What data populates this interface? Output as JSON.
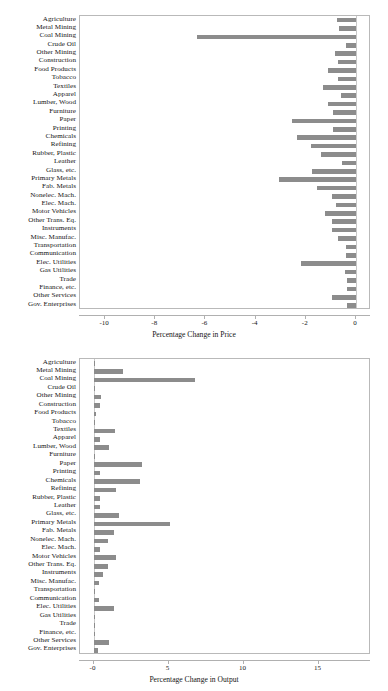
{
  "chart_data": [
    {
      "id": "price",
      "type": "bar",
      "orientation": "horizontal",
      "title": "",
      "xlabel": "Percentage Change in Price",
      "ylabel": "",
      "xlim": [
        -11.0,
        0.6
      ],
      "xticks": [
        -10,
        -8,
        -6,
        -4,
        -2,
        0
      ],
      "xticklabels": [
        "-10",
        "-8",
        "-6",
        "-4",
        "-2",
        "0"
      ],
      "grid": false,
      "legend": false,
      "bar_color": "#8c8c8c",
      "categories": [
        "Agriculture",
        "Metal Mining",
        "Coal Mining",
        "Crude Oil",
        "Other Mining",
        "Construction",
        "Food Products",
        "Tobacco",
        "Textiles",
        "Apparel",
        "Lumber, Wood",
        "Furniture",
        "Paper",
        "Printing",
        "Chemicals",
        "Refining",
        "Rubber, Plastic",
        "Leather",
        "Glass, etc.",
        "Primary Metals",
        "Fab. Metals",
        "Nonelec. Mach.",
        "Elec. Mach.",
        "Motor Vehicles",
        "Other Trans. Eq.",
        "Instruments",
        "Misc. Manufac.",
        "Transportation",
        "Communication",
        "Elec. Utilities",
        "Gas Utilities",
        "Trade",
        "Finance, etc.",
        "Other Services",
        "Gov. Enterprises"
      ],
      "values": [
        -0.75,
        -0.68,
        -6.35,
        -0.38,
        -0.82,
        -0.73,
        -1.12,
        -0.72,
        -1.3,
        -0.6,
        -1.12,
        -0.93,
        -2.55,
        -0.93,
        -2.35,
        -1.8,
        -1.4,
        -0.55,
        -1.75,
        -3.05,
        -1.55,
        -0.95,
        -0.8,
        -1.25,
        -0.95,
        -0.95,
        -0.7,
        -0.4,
        -0.4,
        -2.2,
        -0.45,
        -0.35,
        -0.35,
        -0.95,
        -0.35
      ]
    },
    {
      "id": "output",
      "type": "bar",
      "orientation": "horizontal",
      "title": "",
      "xlabel": "Percentage Change in Output",
      "ylabel": "",
      "xlim": [
        -0.9,
        18.5
      ],
      "xticks": [
        0,
        5,
        10,
        15
      ],
      "xticklabels": [
        "-0",
        "5",
        "10",
        "15"
      ],
      "grid": false,
      "legend": false,
      "bar_color": "#8c8c8c",
      "categories": [
        "Agriculture",
        "Metal Mining",
        "Coal Mining",
        "Crude Oil",
        "Other Mining",
        "Construction",
        "Food Products",
        "Tobacco",
        "Textiles",
        "Apparel",
        "Lumber, Wood",
        "Furniture",
        "Paper",
        "Printing",
        "Chemicals",
        "Refining",
        "Rubber, Plastic",
        "Leather",
        "Glass, etc.",
        "Primary Metals",
        "Fab. Metals",
        "Nonelec. Mach.",
        "Elec. Mach.",
        "Motor Vehicles",
        "Other Trans. Eq.",
        "Instruments",
        "Misc. Manufac.",
        "Transportation",
        "Communication",
        "Elec. Utilities",
        "Gas Utilities",
        "Trade",
        "Finance, etc.",
        "Other Services",
        "Gov. Enterprises"
      ],
      "values": [
        0.05,
        1.95,
        6.75,
        0.05,
        0.5,
        0.42,
        0.15,
        0.1,
        1.4,
        0.45,
        1.0,
        0.1,
        3.2,
        0.45,
        3.1,
        1.5,
        0.45,
        0.42,
        1.7,
        5.1,
        1.35,
        0.95,
        0.45,
        1.5,
        0.95,
        0.65,
        0.35,
        0.05,
        0.35,
        1.35,
        0.03,
        0.04,
        0.1,
        1.0,
        0.28
      ]
    }
  ]
}
